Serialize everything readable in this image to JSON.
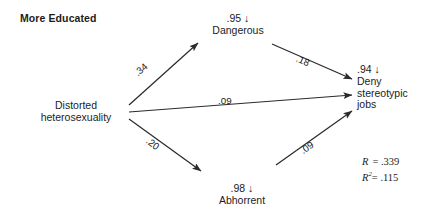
{
  "diagram": {
    "group_title": "More Educated",
    "nodes": [
      {
        "id": "predictor",
        "label": "Distorted\nheterosexuality",
        "line1": "Distorted",
        "line2": "heterosexuality",
        "residual": ""
      },
      {
        "id": "mediator-dangerous",
        "label": "Dangerous",
        "residual": ".95 ↓"
      },
      {
        "id": "mediator-abhorrent",
        "label": "Abhorrent",
        "residual": ".98 ↓"
      },
      {
        "id": "outcome",
        "label": "Deny stereotypic jobs",
        "line1": "Deny",
        "line2": "stereotypic",
        "line3": "jobs",
        "residual": ".94 ↓"
      }
    ],
    "paths": [
      {
        "id": "predictor-to-dangerous",
        "coefficient": ".34"
      },
      {
        "id": "predictor-to-outcome",
        "coefficient": ".09"
      },
      {
        "id": "predictor-to-abhorrent",
        "coefficient": ".20"
      },
      {
        "id": "dangerous-to-outcome",
        "coefficient": ".18"
      },
      {
        "id": "abhorrent-to-outcome",
        "coefficient": ".09"
      }
    ],
    "statistics": {
      "r_symbol": "R",
      "r_equals": "=",
      "r_value": ".339",
      "r2_symbol": "R",
      "r2_exponent": "2",
      "r2_equals": "=",
      "r2_value": ".115"
    },
    "colors": {
      "ink": "#1c1c1c",
      "background": "#ffffff",
      "line": "#2b2b2b"
    }
  }
}
